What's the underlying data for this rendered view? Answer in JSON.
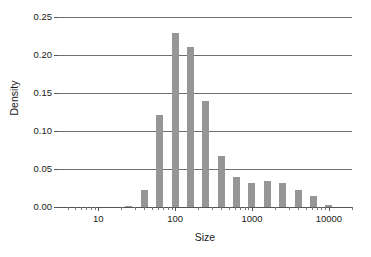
{
  "chart_data": {
    "type": "bar",
    "title": "",
    "subtitle": "",
    "xlabel": "Size",
    "ylabel": "Density",
    "xscale": "log",
    "yscale": "linear",
    "xlim": [
      3,
      20000
    ],
    "ylim": [
      0.0,
      0.25
    ],
    "grid": "horizontal",
    "legend": "none",
    "bar_color": "#969696",
    "axis_color": "#555555",
    "gridline_color": "#6f6f6f",
    "x_tick_labels": [
      "10",
      "100",
      "1000",
      "10000"
    ],
    "x_tick_values": [
      10,
      100,
      1000,
      10000
    ],
    "y_tick_labels": [
      "0.00",
      "0.05",
      "0.10",
      "0.15",
      "0.20",
      "0.25"
    ],
    "y_tick_values": [
      0.0,
      0.05,
      0.1,
      0.15,
      0.2,
      0.25
    ],
    "x_minor_ticks": [
      4,
      5,
      6,
      7,
      8,
      9,
      20,
      30,
      40,
      50,
      60,
      70,
      80,
      90,
      200,
      300,
      400,
      500,
      600,
      700,
      800,
      900,
      2000,
      3000,
      4000,
      5000,
      6000,
      7000,
      8000,
      9000,
      20000
    ],
    "bin_centers": [
      25,
      40,
      63,
      100,
      160,
      250,
      400,
      630,
      1000,
      1600,
      2500,
      4000,
      6300,
      10000
    ],
    "values": [
      0.001,
      0.023,
      0.121,
      0.229,
      0.211,
      0.139,
      0.067,
      0.04,
      0.032,
      0.034,
      0.032,
      0.023,
      0.015,
      0.002
    ],
    "categories": [
      "25",
      "40",
      "63",
      "100",
      "160",
      "250",
      "400",
      "630",
      "1000",
      "1600",
      "2500",
      "4000",
      "6300",
      "10000"
    ],
    "bar_width_px": 7
  }
}
